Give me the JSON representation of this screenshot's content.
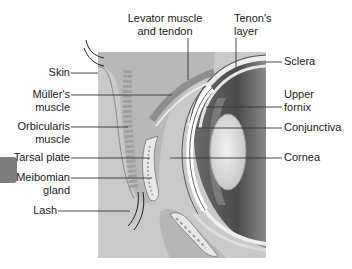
{
  "figure": {
    "colors": {
      "background_panel": "#c9c9c9",
      "leader_line": "#333333",
      "label_text": "#1a1a1a",
      "side_tab": "#7d7d7d"
    }
  },
  "labels_top": [
    {
      "id": "levator",
      "lines": [
        "Levator muscle",
        "and tendon"
      ]
    },
    {
      "id": "tenon",
      "lines": [
        "Tenon's",
        "layer"
      ]
    }
  ],
  "labels_left": [
    {
      "id": "skin",
      "lines": [
        "Skin"
      ]
    },
    {
      "id": "muller",
      "lines": [
        "Müller's",
        "muscle"
      ]
    },
    {
      "id": "orbicularis",
      "lines": [
        "Orbicularis",
        "muscle"
      ]
    },
    {
      "id": "tarsal",
      "lines": [
        "Tarsal plate"
      ]
    },
    {
      "id": "meibomian",
      "lines": [
        "Meibomian",
        "gland"
      ]
    },
    {
      "id": "lash",
      "lines": [
        "Lash"
      ]
    }
  ],
  "labels_right": [
    {
      "id": "sclera",
      "lines": [
        "Sclera"
      ]
    },
    {
      "id": "fornix",
      "lines": [
        "Upper",
        "fornix"
      ]
    },
    {
      "id": "conjunctiva",
      "lines": [
        "Conjunctiva"
      ]
    },
    {
      "id": "cornea",
      "lines": [
        "Cornea"
      ]
    }
  ]
}
